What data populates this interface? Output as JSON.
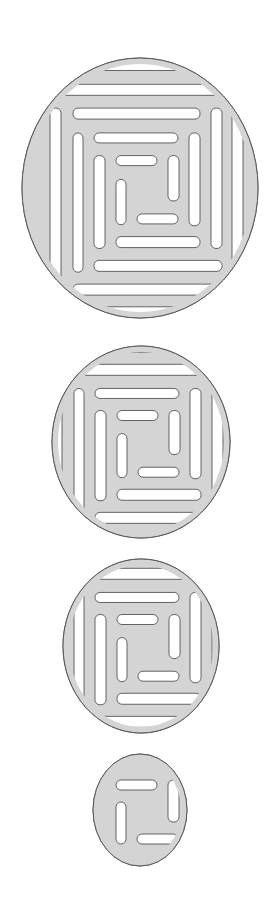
{
  "canvas": {
    "width": 272,
    "height": 905,
    "background": "#ffffff"
  },
  "style": {
    "fill": "#d4d4d4",
    "stroke": "#555555",
    "slot_fill": "#ffffff"
  },
  "slots": [
    {
      "ring": 0,
      "side": "top",
      "x": -24,
      "y": -30,
      "w": 41,
      "h": 10
    },
    {
      "ring": 0,
      "side": "right",
      "x": 28,
      "y": -30,
      "w": 11,
      "h": 42
    },
    {
      "ring": 0,
      "side": "bottom",
      "x": -3,
      "y": 24,
      "w": 41,
      "h": 10
    },
    {
      "ring": 0,
      "side": "left",
      "x": -24,
      "y": -8,
      "w": 10,
      "h": 42
    },
    {
      "ring": 1,
      "side": "top",
      "x": -46,
      "y": -51,
      "w": 84,
      "h": 10
    },
    {
      "ring": 1,
      "side": "right",
      "x": 49,
      "y": -51,
      "w": 11,
      "h": 86
    },
    {
      "ring": 1,
      "side": "bottom",
      "x": -24,
      "y": 45,
      "w": 84,
      "h": 11
    },
    {
      "ring": 1,
      "side": "left",
      "x": -46,
      "y": -30,
      "w": 11,
      "h": 86
    },
    {
      "ring": 2,
      "side": "top",
      "x": -67,
      "y": -74,
      "w": 127,
      "h": 11
    },
    {
      "ring": 2,
      "side": "right",
      "x": 71,
      "y": -74,
      "w": 11,
      "h": 130
    },
    {
      "ring": 2,
      "side": "bottom",
      "x": -46,
      "y": 67,
      "w": 128,
      "h": 11
    },
    {
      "ring": 2,
      "side": "left",
      "x": -67,
      "y": -51,
      "w": 10,
      "h": 129
    },
    {
      "ring": 3,
      "side": "top",
      "x": -89,
      "y": -96,
      "w": 172,
      "h": 11
    },
    {
      "ring": 3,
      "side": "right",
      "x": 92,
      "y": -96,
      "w": 11,
      "h": 174
    },
    {
      "ring": 3,
      "side": "bottom",
      "x": -67,
      "y": 89,
      "w": 170,
      "h": 11
    },
    {
      "ring": 3,
      "side": "left",
      "x": -90,
      "y": -74,
      "w": 11,
      "h": 174
    },
    {
      "ring": 4,
      "side": "top",
      "x": -112,
      "y": -119,
      "w": 215,
      "h": 11
    },
    {
      "ring": 4,
      "side": "right",
      "x": 113,
      "y": -119,
      "w": 11,
      "h": 216
    },
    {
      "ring": 4,
      "side": "bottom",
      "x": -90,
      "y": 110,
      "w": 215,
      "h": 11
    },
    {
      "ring": 4,
      "side": "left",
      "x": -124,
      "y": -96,
      "w": 11,
      "h": 216
    }
  ],
  "disks": [
    {
      "id": "disk-large",
      "cx": 140,
      "cy": 188,
      "rx": 118,
      "ry": 130,
      "sy": 1.08,
      "rings": 5
    },
    {
      "id": "disk-medium",
      "cx": 141,
      "cy": 442,
      "rx": 89,
      "ry": 96,
      "sy": 1.05,
      "rings": 4
    },
    {
      "id": "disk-small",
      "cx": 141,
      "cy": 646,
      "rx": 78,
      "ry": 87,
      "sy": 1.05,
      "rings": 4
    },
    {
      "id": "disk-tiny",
      "cx": 140,
      "cy": 810,
      "rx": 47,
      "ry": 56,
      "sy": 1.0,
      "rings": 1
    }
  ]
}
